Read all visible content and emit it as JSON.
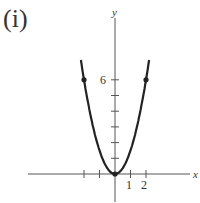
{
  "panel_label": "(i)",
  "chart_data": {
    "type": "line",
    "title": "(i)",
    "xlabel": "x",
    "ylabel": "y",
    "function": "y = 1.5x^2",
    "series": [
      {
        "name": "parabola",
        "x": [
          -2.2,
          -2,
          -1.5,
          -1,
          -0.5,
          0,
          0.5,
          1,
          1.5,
          2,
          2.2
        ],
        "values": [
          7.26,
          6,
          3.375,
          1.5,
          0.375,
          0,
          0.375,
          1.5,
          3.375,
          6,
          7.26
        ]
      }
    ],
    "marked_points": [
      {
        "x": -2,
        "y": 6
      },
      {
        "x": 0,
        "y": 0
      },
      {
        "x": 2,
        "y": 6
      }
    ],
    "x_ticks": [
      -2,
      -1,
      1,
      2
    ],
    "x_tick_labels": [
      "1",
      "2"
    ],
    "y_ticks": [
      1,
      2,
      3,
      4,
      5,
      6
    ],
    "y_tick_labels": [
      "6"
    ],
    "xlim": [
      -3.2,
      3.2
    ],
    "ylim": [
      -1.5,
      7.5
    ],
    "grid": false
  },
  "labels": {
    "y_axis": "y",
    "x_axis": "x",
    "tick_6": "6",
    "tick_1": "1",
    "tick_2": "2"
  }
}
